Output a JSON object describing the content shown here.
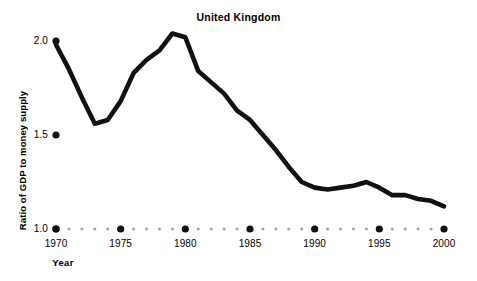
{
  "chart_data": {
    "type": "line",
    "title": "United Kingdom",
    "xlabel": "Year",
    "ylabel": "Ratio of GDP to money supply",
    "xlim": [
      1970,
      2000
    ],
    "ylim": [
      1.0,
      2.1
    ],
    "grid": false,
    "legend": null,
    "line_color": "#111111",
    "axis_dot_color": "#111111",
    "minor_dot_color": "#a8a8a8",
    "background": "#ffffff",
    "yticks": [
      1.0,
      1.5,
      2.0
    ],
    "ytick_labels": [
      "1.0",
      "1.5",
      "2.0"
    ],
    "xticks": [
      1970,
      1975,
      1980,
      1985,
      1990,
      1995,
      2000
    ],
    "xtick_labels": [
      "1970",
      "1975",
      "1980",
      "1985",
      "1990",
      "1995",
      "2000"
    ],
    "x": [
      1970,
      1971,
      1972,
      1973,
      1974,
      1975,
      1976,
      1977,
      1978,
      1979,
      1980,
      1981,
      1982,
      1983,
      1984,
      1985,
      1986,
      1987,
      1988,
      1989,
      1990,
      1991,
      1992,
      1993,
      1994,
      1995,
      1996,
      1997,
      1998,
      1999,
      2000
    ],
    "values": [
      1.98,
      1.85,
      1.7,
      1.56,
      1.58,
      1.68,
      1.83,
      1.9,
      1.95,
      2.04,
      2.02,
      1.84,
      1.78,
      1.72,
      1.63,
      1.58,
      1.5,
      1.42,
      1.33,
      1.25,
      1.22,
      1.21,
      1.22,
      1.23,
      1.25,
      1.22,
      1.18,
      1.18,
      1.16,
      1.15,
      1.12
    ],
    "series": [
      {
        "name": "United Kingdom",
        "values": [
          1.98,
          1.85,
          1.7,
          1.56,
          1.58,
          1.68,
          1.83,
          1.9,
          1.95,
          2.04,
          2.02,
          1.84,
          1.78,
          1.72,
          1.63,
          1.58,
          1.5,
          1.42,
          1.33,
          1.25,
          1.22,
          1.21,
          1.22,
          1.23,
          1.25,
          1.22,
          1.18,
          1.18,
          1.16,
          1.15,
          1.12
        ]
      }
    ]
  }
}
